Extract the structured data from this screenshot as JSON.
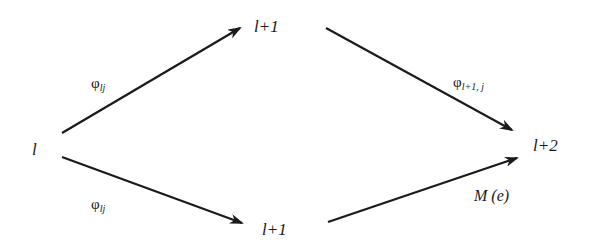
{
  "diagram": {
    "nodes": [
      {
        "id": "start",
        "text": "l",
        "x": 32,
        "y": 141
      },
      {
        "id": "mid-top",
        "text": "l+1",
        "x": 254,
        "y": 18
      },
      {
        "id": "mid-bottom",
        "text": "l+1",
        "x": 262,
        "y": 221
      },
      {
        "id": "end",
        "text": "l+2",
        "x": 533,
        "y": 137
      }
    ],
    "edges": [
      {
        "id": "start-to-mid-top",
        "from": "start",
        "to": "mid-top",
        "label": {
          "symbol": "φ",
          "sub": "lj"
        },
        "x1": 62,
        "y1": 133,
        "x2": 240,
        "y2": 28
      },
      {
        "id": "start-to-mid-bottom",
        "from": "start",
        "to": "mid-bottom",
        "label": {
          "symbol": "φ",
          "sub": "lj"
        },
        "x1": 62,
        "y1": 157,
        "x2": 242,
        "y2": 223
      },
      {
        "id": "mid-top-to-end",
        "from": "mid-top",
        "to": "end",
        "label": {
          "symbol": "φ",
          "sub": "l+1, j"
        },
        "x1": 326,
        "y1": 28,
        "x2": 512,
        "y2": 130
      },
      {
        "id": "mid-bottom-to-end",
        "from": "mid-bottom",
        "to": "end",
        "label": {
          "text": "M (e)"
        },
        "x1": 328,
        "y1": 222,
        "x2": 517,
        "y2": 158
      }
    ],
    "stroke_color": "#1a1a1a"
  },
  "labels": {
    "start": "l",
    "mid_top": "l+1",
    "mid_bottom": "l+1",
    "end": "l+2",
    "phi": "φ",
    "phi_lj_sub": "lj",
    "phi_l1j_sub": "l+1, j",
    "m_e": "M (e)"
  }
}
